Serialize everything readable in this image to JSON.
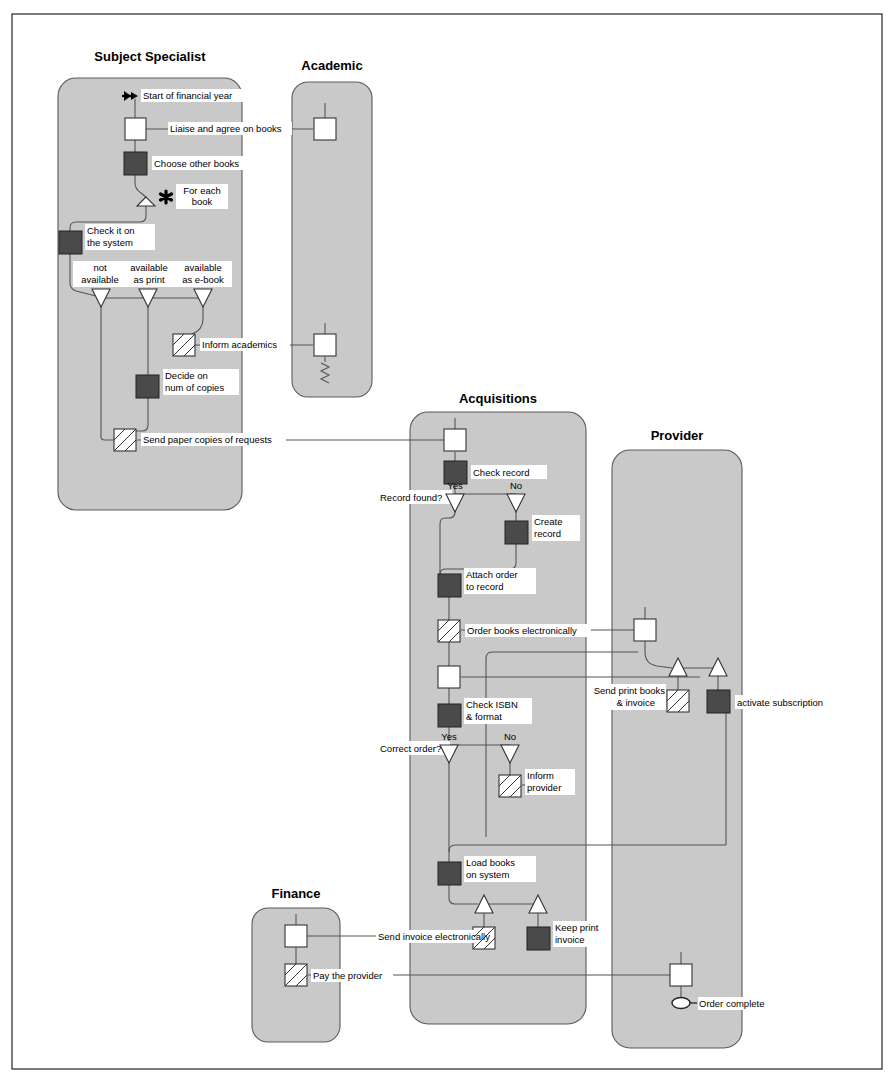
{
  "diagram": {
    "frame": {
      "x": 12,
      "y": 14,
      "w": 870,
      "h": 1055
    },
    "colors": {
      "lane_fill": "#c9c9c9",
      "lane_stroke": "#5a5a5a",
      "node_dark": "#4a4a4a",
      "node_white": "#ffffff",
      "flow_line": "#555555",
      "text": "#000000"
    },
    "lanes": [
      {
        "id": "subject-specialist",
        "title": "Subject Specialist",
        "x": 58,
        "y": 78,
        "w": 184,
        "h": 432,
        "title_x": 150,
        "title_y": 61
      },
      {
        "id": "academic",
        "title": "Academic",
        "x": 292,
        "y": 82,
        "w": 80,
        "h": 315,
        "title_x": 332,
        "title_y": 70
      },
      {
        "id": "acquisitions",
        "title": "Acquisitions",
        "x": 410,
        "y": 412,
        "w": 176,
        "h": 612,
        "title_x": 498,
        "title_y": 403
      },
      {
        "id": "provider",
        "title": "Provider",
        "x": 612,
        "y": 450,
        "w": 130,
        "h": 598,
        "title_x": 677,
        "title_y": 440
      },
      {
        "id": "finance",
        "title": "Finance",
        "x": 252,
        "y": 908,
        "w": 88,
        "h": 134,
        "title_x": 296,
        "title_y": 898
      }
    ],
    "labels": {
      "start_of_financial_year": "Start of financial year",
      "liaise_and_agree_on_books": "Liaise and agree on books",
      "choose_other_books": "Choose other books",
      "for_each_book_line1": "For each",
      "for_each_book_line2": "book",
      "check_it_on_line1": "Check it on",
      "check_it_on_line2": "the system",
      "not_available_line1": "not",
      "not_available_line2": "available",
      "available_as_print_line1": "available",
      "available_as_print_line2": "as print",
      "available_as_ebook_line1": "available",
      "available_as_ebook_line2": "as e-book",
      "inform_academics": "Inform academics",
      "decide_on_line1": "Decide on",
      "decide_on_line2": "num of copies",
      "send_paper_copies": "Send paper copies of requests",
      "check_record": "Check record",
      "record_found": "Record found?",
      "yes_1": "Yes",
      "no_1": "No",
      "create_record_line1": "Create",
      "create_record_line2": "record",
      "attach_order_line1": "Attach order",
      "attach_order_line2": "to record",
      "order_books_electronically": "Order books electronically",
      "send_print_books_line1": "Send print books",
      "send_print_books_line2": "& invoice",
      "activate_subscription": "activate subscription",
      "check_isbn_line1": "Check ISBN",
      "check_isbn_line2": "& format",
      "correct_order": "Correct order?",
      "yes_2": "Yes",
      "no_2": "No",
      "inform_provider_line1": "Inform",
      "inform_provider_line2": "provider",
      "load_books_line1": "Load books",
      "load_books_line2": "on system",
      "send_invoice_electronically": "Send invoice electronically",
      "keep_print_line1": "Keep print",
      "keep_print_line2": "invoice",
      "pay_the_provider": "Pay the provider",
      "order_complete": "Order complete"
    }
  }
}
